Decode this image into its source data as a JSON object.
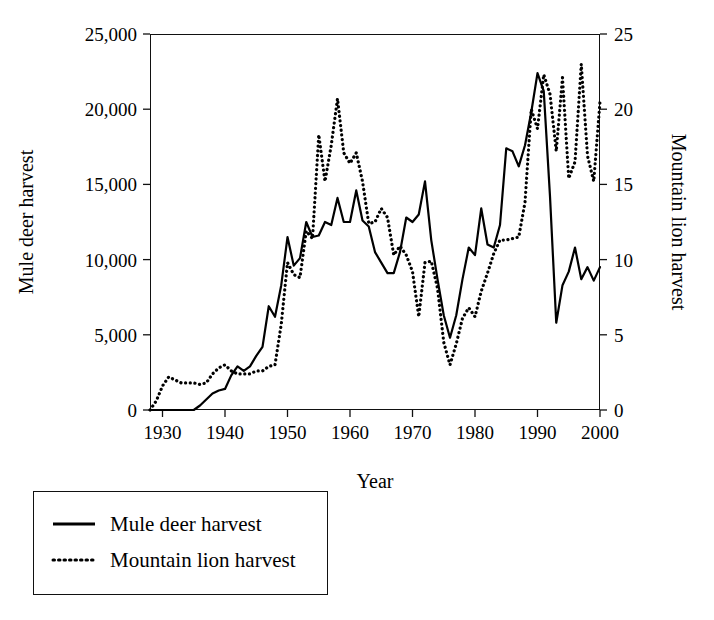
{
  "chart_data": {
    "type": "line",
    "title": "",
    "xlabel": "Year",
    "ylabel": "Mule deer harvest",
    "y2label": "Mountain lion harvest",
    "xlim": [
      1928,
      2000
    ],
    "ylim": [
      0,
      25000
    ],
    "y2lim": [
      0,
      25
    ],
    "grid": false,
    "legend_position": "below-left",
    "xticks": [
      "1930",
      "1940",
      "1950",
      "1960",
      "1970",
      "1980",
      "1990",
      "2000"
    ],
    "xtick_values": [
      1930,
      1940,
      1950,
      1960,
      1970,
      1980,
      1990,
      2000
    ],
    "yticks": [
      "0",
      "5,000",
      "10,000",
      "15,000",
      "20,000",
      "25,000"
    ],
    "ytick_values": [
      0,
      5000,
      10000,
      15000,
      20000,
      25000
    ],
    "y2ticks": [
      "0",
      "5",
      "10",
      "15",
      "20",
      "25"
    ],
    "y2tick_values": [
      0,
      5,
      10,
      15,
      20,
      25
    ],
    "x": [
      1928,
      1929,
      1930,
      1931,
      1932,
      1933,
      1934,
      1935,
      1936,
      1937,
      1938,
      1939,
      1940,
      1941,
      1942,
      1943,
      1944,
      1945,
      1946,
      1947,
      1948,
      1949,
      1950,
      1951,
      1952,
      1953,
      1954,
      1955,
      1956,
      1957,
      1958,
      1959,
      1960,
      1961,
      1962,
      1963,
      1964,
      1965,
      1966,
      1967,
      1968,
      1969,
      1970,
      1971,
      1972,
      1973,
      1974,
      1975,
      1976,
      1977,
      1978,
      1979,
      1980,
      1981,
      1982,
      1983,
      1984,
      1985,
      1986,
      1987,
      1988,
      1989,
      1990,
      1991,
      1992,
      1993,
      1994,
      1995,
      1996,
      1997,
      1998,
      1999,
      2000
    ],
    "series": [
      {
        "name": "Mule deer harvest",
        "axis": "left",
        "style": "solid",
        "color": "#000000",
        "values": [
          0,
          0,
          0,
          0,
          0,
          0,
          0,
          0,
          300,
          700,
          1100,
          1300,
          1400,
          2300,
          2900,
          2600,
          2900,
          3600,
          4200,
          6900,
          6200,
          8300,
          11500,
          9600,
          10100,
          12500,
          11500,
          11600,
          12500,
          12300,
          14100,
          12500,
          12500,
          14600,
          12600,
          12200,
          10500,
          9800,
          9100,
          9100,
          10500,
          12800,
          12500,
          13000,
          15200,
          11300,
          8700,
          6300,
          4800,
          6300,
          8700,
          10800,
          10300,
          13400,
          11000,
          10800,
          12300,
          17400,
          17200,
          16200,
          17600,
          19800,
          22400,
          21200,
          14200,
          5800,
          8300,
          9200,
          10800,
          8700,
          9500,
          8600,
          9500
        ]
      },
      {
        "name": "Mountain lion harvest",
        "axis": "right",
        "style": "dotted",
        "color": "#000000",
        "values": [
          0,
          0.6,
          1.6,
          2.2,
          2.0,
          1.8,
          1.8,
          1.8,
          1.7,
          1.8,
          2.4,
          2.8,
          3.0,
          2.6,
          2.4,
          2.4,
          2.4,
          2.6,
          2.6,
          2.9,
          3.0,
          5.7,
          9.8,
          9.0,
          8.8,
          11.9,
          11.4,
          18.3,
          15.2,
          17.6,
          20.7,
          17.1,
          16.4,
          17.1,
          15.2,
          12.4,
          12.5,
          13.4,
          12.8,
          10.3,
          10.9,
          10.3,
          9.2,
          6.2,
          9.8,
          9.9,
          8.1,
          4.5,
          3.0,
          4.4,
          6.1,
          6.8,
          6.2,
          7.9,
          9.1,
          10.4,
          11.3,
          11.3,
          11.4,
          11.5,
          13.8,
          20.0,
          18.7,
          22.3,
          21.0,
          17.2,
          22.1,
          15.4,
          16.5,
          23.0,
          16.9,
          15.2,
          20.5
        ]
      }
    ],
    "legend": [
      {
        "label": "Mule deer harvest",
        "style": "solid"
      },
      {
        "label": "Mountain lion harvest",
        "style": "dotted"
      }
    ]
  }
}
